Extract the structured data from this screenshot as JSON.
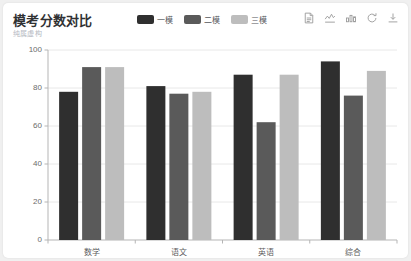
{
  "header": {
    "title": "模考分数对比",
    "subtitle": "纯属虚构"
  },
  "legend": {
    "items": [
      {
        "label": "一模",
        "color": "#2f2f2f"
      },
      {
        "label": "二模",
        "color": "#5a5a5a"
      },
      {
        "label": "三模",
        "color": "#bdbdbd"
      }
    ]
  },
  "toolbox": {
    "items": [
      {
        "name": "data-view-icon",
        "title": "数据视图"
      },
      {
        "name": "line-chart-icon",
        "title": "切换为折线图"
      },
      {
        "name": "bar-chart-icon",
        "title": "切换为柱状图"
      },
      {
        "name": "refresh-icon",
        "title": "还原"
      },
      {
        "name": "download-icon",
        "title": "保存为图片"
      }
    ]
  },
  "chart_data": {
    "type": "bar",
    "title": "模考分数对比",
    "subtitle": "纯属虚构",
    "xlabel": "",
    "ylabel": "",
    "ylim": [
      0,
      100
    ],
    "ytick_labels": [
      "0",
      "20",
      "40",
      "60",
      "80",
      "100"
    ],
    "yticks": [
      0,
      20,
      40,
      60,
      80,
      100
    ],
    "grid": true,
    "legend_position": "top-center",
    "categories": [
      "数学",
      "语文",
      "英语",
      "综合"
    ],
    "series": [
      {
        "name": "一模",
        "color": "#2f2f2f",
        "values": [
          78,
          81,
          87,
          94
        ]
      },
      {
        "name": "二模",
        "color": "#5a5a5a",
        "values": [
          91,
          77,
          62,
          76
        ]
      },
      {
        "name": "三模",
        "color": "#bdbdbd",
        "values": [
          91,
          78,
          87,
          89
        ]
      }
    ]
  }
}
